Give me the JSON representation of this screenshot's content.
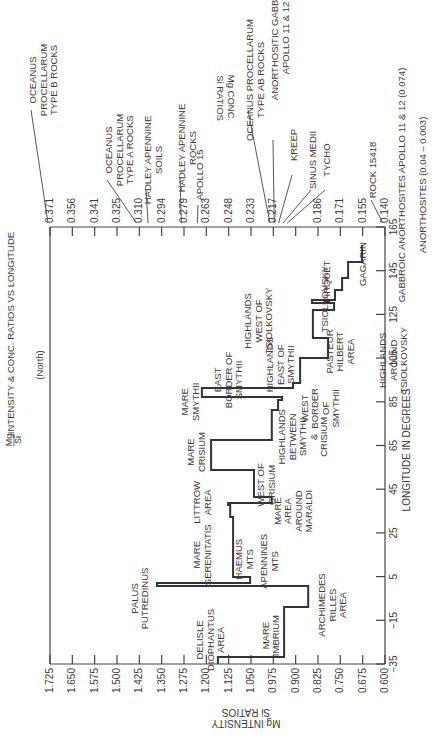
{
  "chart_data": {
    "type": "line",
    "style": "step",
    "orientation": "rotated-90-ccw",
    "title_fraction": {
      "num": "Mg",
      "den": "Si"
    },
    "title_rest": "INTENSITY & CONC. RATIOS VS LONGITUDE",
    "subtitle": "(North)",
    "xlabel": "LONGITUDE IN DEGREES",
    "ylabel": "Mg/Si INTENSITY RATIOS",
    "ylabel_line1": "Mg INTENSITY",
    "ylabel_frac_den": "Si",
    "ylabel_line2": "RATIOS",
    "y2label": "Mg/Si CONC. RATIOS",
    "y2label_line1": "Mg CONC.",
    "y2label_line2": "Si RATIOS",
    "xlim": [
      -35,
      165
    ],
    "ylim": [
      0.6,
      1.725
    ],
    "x_ticks": [
      -35,
      -15,
      5,
      25,
      45,
      65,
      85,
      105,
      125,
      145,
      165
    ],
    "x_tick_labels": [
      "−35",
      "−15",
      "5",
      "25",
      "45",
      "65",
      "85",
      "105",
      "125",
      "145",
      "165"
    ],
    "y_ticks": [
      "1.725",
      "1.650",
      "1.575",
      "1.500",
      "1.425",
      "1.350",
      "1.275",
      "1.200",
      "1.125",
      "1.050",
      "0.975",
      "0.900",
      "0.825",
      "0.750",
      "0.675",
      "0.600"
    ],
    "y2_ticks": [
      "0.371",
      "0.356",
      "0.341",
      "0.325",
      "0.310",
      "0.294",
      "0.279",
      "0.263",
      "0.248",
      "0.233",
      "0.217",
      "0.202",
      "0.186",
      "0.171",
      "0.155",
      "0.140"
    ],
    "grid": false,
    "series": [
      {
        "name": "Mg/Si intensity ratio",
        "points": [
          [
            -35,
            1.161
          ],
          [
            -31.8,
            1.161
          ],
          [
            -31.8,
            0.939
          ],
          [
            -8.9,
            0.939
          ],
          [
            -8.9,
            0.858
          ],
          [
            0.7,
            0.858
          ],
          [
            0.7,
            1.366
          ],
          [
            2.1,
            1.366
          ],
          [
            2.1,
            1.053
          ],
          [
            4.8,
            1.053
          ],
          [
            4.8,
            1.11
          ],
          [
            32.3,
            1.11
          ],
          [
            32.3,
            1.12
          ],
          [
            37.8,
            1.12
          ],
          [
            37.8,
            1.127
          ],
          [
            38.7,
            1.127
          ],
          [
            38.7,
            0.98
          ],
          [
            41.4,
            0.98
          ],
          [
            41.4,
            1.04
          ],
          [
            53.8,
            1.04
          ],
          [
            53.8,
            1.184
          ],
          [
            67.5,
            1.184
          ],
          [
            67.5,
            0.98
          ],
          [
            81.3,
            0.98
          ],
          [
            81.3,
            0.959
          ],
          [
            85.8,
            0.959
          ],
          [
            85.8,
            0.946
          ],
          [
            87.2,
            0.946
          ],
          [
            87.2,
            1.215
          ],
          [
            91.3,
            1.215
          ],
          [
            91.3,
            0.909
          ],
          [
            93.6,
            0.909
          ],
          [
            93.6,
            0.885
          ],
          [
            105.0,
            0.885
          ],
          [
            105.0,
            0.791
          ],
          [
            114.2,
            0.791
          ],
          [
            114.2,
            0.842
          ],
          [
            127.0,
            0.842
          ],
          [
            127.0,
            0.771
          ],
          [
            130.2,
            0.771
          ],
          [
            130.2,
            0.845
          ],
          [
            131.6,
            0.845
          ],
          [
            131.6,
            0.768
          ],
          [
            136.2,
            0.768
          ],
          [
            136.2,
            0.744
          ],
          [
            141.6,
            0.744
          ],
          [
            141.6,
            0.724
          ],
          [
            149.0,
            0.724
          ],
          [
            149.0,
            0.677
          ],
          [
            156.8,
            0.677
          ]
        ]
      }
    ],
    "region_labels": [
      {
        "lines": [
          "DELISLE",
          "DIOPHANTUS",
          "AREA"
        ],
        "lon": -24,
        "val": 1.21
      },
      {
        "lines": [
          "MARE",
          "IMBRIUM"
        ],
        "lon": -22,
        "val": 0.99
      },
      {
        "lines": [
          "ARCHIMEDES",
          "RILLES",
          "AREA"
        ],
        "lon": -8,
        "val": 0.8
      },
      {
        "lines": [
          "PALUS",
          "PUTREDINUS"
        ],
        "lon": -5,
        "val": 1.43
      },
      {
        "lines": [
          "APENNINES",
          "MTS"
        ],
        "lon": 12,
        "val": 0.995
      },
      {
        "lines": [
          "MARE",
          "SERENITATIS"
        ],
        "lon": 15,
        "val": 1.22
      },
      {
        "lines": [
          "HAEMUS",
          "MTS"
        ],
        "lon": 13,
        "val": 1.08
      },
      {
        "lines": [
          "LITTROW",
          "AREA"
        ],
        "lon": 39,
        "val": 1.22
      },
      {
        "lines": [
          "MARE",
          "AREA",
          "AROUND",
          "MARALDI"
        ],
        "lon": 35,
        "val": 0.95
      },
      {
        "lines": [
          "WEST OF",
          "CRISIUM"
        ],
        "lon": 47,
        "val": 1.005
      },
      {
        "lines": [
          "MARE",
          "CRISIUM"
        ],
        "lon": 62,
        "val": 1.24
      },
      {
        "lines": [
          "HIGHLANDS",
          "BETWEEN",
          "SMYTHII",
          "&",
          "CRISIUM"
        ],
        "lon": 69,
        "val": 0.935
      },
      {
        "lines": [
          "MARE",
          "SMYTHII"
        ],
        "lon": 85,
        "val": 1.26
      },
      {
        "lines": [
          "WEST",
          "BORDER",
          "OF",
          "SMYTHII"
        ],
        "lon": 82,
        "val": 0.86
      },
      {
        "lines": [
          "EAST",
          "BORDER OF",
          "SMYTHII"
        ],
        "lon": 95,
        "val": 1.15
      },
      {
        "lines": [
          "HIGHLANDS",
          "EAST OF",
          "SMYTHII"
        ],
        "lon": 102,
        "val": 0.975
      },
      {
        "lines": [
          "PASTEUR",
          "HILBERT",
          "AREA"
        ],
        "lon": 108,
        "val": 0.775
      },
      {
        "lines": [
          "HIGHLANDS",
          "WEST OF",
          "TSIOLKOVSKY"
        ],
        "lon": 122,
        "val": 1.05
      },
      {
        "lines": [
          "TSIOLKOVSKY"
        ],
        "lon": 132,
        "val": 0.79
      },
      {
        "lines": [
          "PIRQUET"
        ],
        "lon": 140,
        "val": 0.785
      },
      {
        "lines": [
          "GAGARIN"
        ],
        "lon": 148,
        "val": 0.665
      },
      {
        "lines": [
          "HIGHLANDS",
          "AROUND",
          "TSIOLKOVSKY"
        ],
        "lon": 104,
        "val": 0.595
      }
    ],
    "reference_annotations": [
      {
        "lines": [
          "OCEANUS",
          "PROCELLARUM",
          "TYPE  B  ROCKS"
        ],
        "conc": 0.371
      },
      {
        "lines": [
          "OCEANUS",
          "PROCELLARUM",
          "TYPE A ROCKS"
        ],
        "conc": 0.31
      },
      {
        "lines": [
          "HADLEY APENNINE",
          "SOILS"
        ],
        "conc": 0.302
      },
      {
        "lines": [
          "HADLEY APENNINE",
          "ROCKS"
        ],
        "conc": 0.279
      },
      {
        "lines": [
          "APOLLO 15"
        ],
        "conc": 0.268
      },
      {
        "lines": [
          "OCEANUS PROCELLARUM",
          "TYPE  AB  ROCKS"
        ],
        "conc": 0.218
      },
      {
        "lines": [
          "ANORTHOSITIC GABBROIC",
          "APOLLO 11 & 12"
        ],
        "conc": 0.215
      },
      {
        "lines": [
          "KREEP"
        ],
        "conc": 0.212
      },
      {
        "lines": [
          "SINUS MEDII"
        ],
        "conc": 0.209
      },
      {
        "lines": [
          "TYCHO"
        ],
        "conc": 0.206
      },
      {
        "lines": [
          "ROCK 15418"
        ],
        "conc": 0.14
      },
      {
        "lines": [
          "GABBROIC ANORTHOSITES APOLLO 11 & 12  (0.074)"
        ],
        "conc": 0.074
      },
      {
        "lines": [
          "ANORTHOSITES  (0.04 – 0.003)"
        ],
        "conc": 0.02
      }
    ]
  }
}
